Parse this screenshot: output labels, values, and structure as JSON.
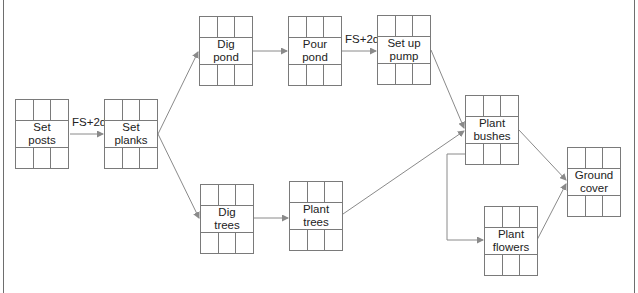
{
  "diagram": {
    "type": "precedence network (activity-on-node)",
    "nodes": [
      {
        "id": "set-posts",
        "label": "Set\nposts",
        "x": 15,
        "y": 99
      },
      {
        "id": "set-planks",
        "label": "Set\nplanks",
        "x": 104,
        "y": 99
      },
      {
        "id": "dig-pond",
        "label": "Dig\npond",
        "x": 199,
        "y": 16
      },
      {
        "id": "pour-pond",
        "label": "Pour\npond",
        "x": 288,
        "y": 16
      },
      {
        "id": "set-up-pump",
        "label": "Set up\npump",
        "x": 377,
        "y": 15
      },
      {
        "id": "dig-trees",
        "label": "Dig\ntrees",
        "x": 200,
        "y": 184
      },
      {
        "id": "plant-trees",
        "label": "Plant\ntrees",
        "x": 289,
        "y": 181
      },
      {
        "id": "plant-bushes",
        "label": "Plant\nbushes",
        "x": 465,
        "y": 95
      },
      {
        "id": "plant-flowers",
        "label": "Plant\nflowers",
        "x": 484,
        "y": 206
      },
      {
        "id": "ground-cover",
        "label": "Ground\ncover",
        "x": 567,
        "y": 147
      }
    ],
    "edges": [
      {
        "from": "set-posts",
        "to": "set-planks",
        "lag": "FS+2d"
      },
      {
        "from": "set-planks",
        "to": "dig-pond"
      },
      {
        "from": "set-planks",
        "to": "dig-trees"
      },
      {
        "from": "dig-pond",
        "to": "pour-pond"
      },
      {
        "from": "pour-pond",
        "to": "set-up-pump",
        "lag": "FS+2d"
      },
      {
        "from": "set-up-pump",
        "to": "plant-bushes"
      },
      {
        "from": "dig-trees",
        "to": "plant-trees"
      },
      {
        "from": "plant-trees",
        "to": "plant-bushes"
      },
      {
        "from": "plant-bushes",
        "to": "plant-flowers"
      },
      {
        "from": "plant-bushes",
        "to": "ground-cover"
      },
      {
        "from": "plant-flowers",
        "to": "ground-cover"
      }
    ],
    "lags": {
      "set_posts_to_set_planks": "FS+2d",
      "pour_pond_to_set_up_pump": "FS+2d"
    },
    "colors": {
      "line": "#8a8a8a",
      "box_border": "#7a7a7a",
      "text": "#222222"
    }
  }
}
